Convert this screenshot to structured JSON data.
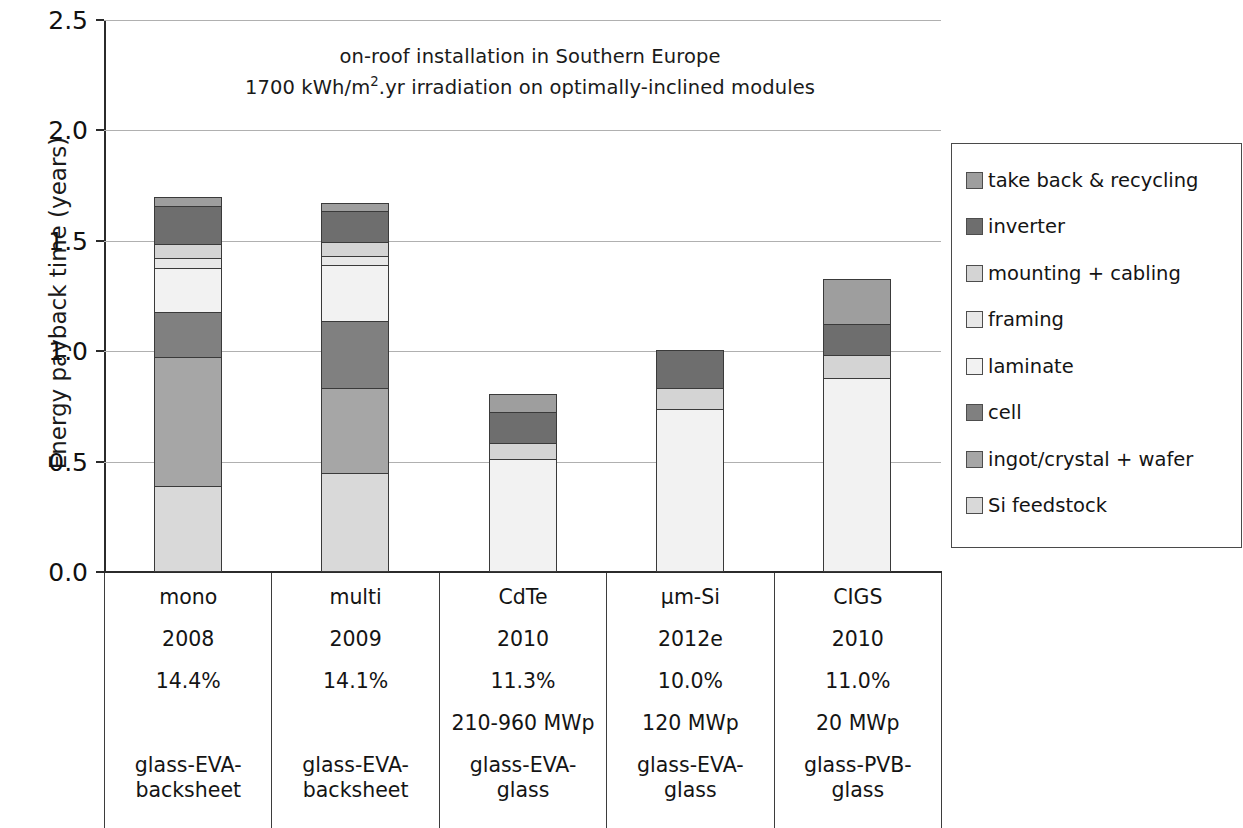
{
  "chart_data": {
    "type": "bar",
    "subtype": "stacked-bar",
    "title": "on-roof installation in Southern Europe\n1700 kWh/m2.yr irradiation on optimally-inclined modules",
    "title_lines": [
      "on-roof installation in Southern Europe",
      "1700 kWh/m².yr irradiation on optimally-inclined modules"
    ],
    "xlabel": "",
    "ylabel": "Energy payback time (years)",
    "ylim": [
      0.0,
      2.5
    ],
    "ytick_labels": [
      "2.5",
      "2.0",
      "1.5",
      "1.0",
      "0.5",
      "0.0"
    ],
    "ytick_values": [
      2.5,
      2.0,
      1.5,
      1.0,
      0.5,
      0.0
    ],
    "grid": "horizontal",
    "legend_position": "right",
    "categories": [
      "mono",
      "multi",
      "CdTe",
      "μm-Si",
      "CIGS"
    ],
    "stack_order_bottom_to_top": [
      "Si feedstock",
      "ingot/crystal + wafer",
      "cell",
      "laminate",
      "framing",
      "mounting + cabling",
      "inverter",
      "take back & recycling"
    ],
    "series": [
      {
        "name": "Si feedstock",
        "color": "#d9d9d9",
        "values": [
          0.39,
          0.45,
          0.0,
          0.0,
          0.0
        ]
      },
      {
        "name": "ingot/crystal + wafer",
        "color": "#a6a6a6",
        "values": [
          0.59,
          0.39,
          0.0,
          0.0,
          0.0
        ]
      },
      {
        "name": "cell",
        "color": "#808080",
        "values": [
          0.21,
          0.31,
          0.0,
          0.0,
          0.0
        ]
      },
      {
        "name": "laminate",
        "color": "#f2f2f2",
        "values": [
          0.21,
          0.26,
          0.51,
          0.74,
          0.88
        ]
      },
      {
        "name": "framing",
        "color": "#e8e8e8",
        "values": [
          0.05,
          0.05,
          0.0,
          0.0,
          0.0
        ]
      },
      {
        "name": "mounting + cabling",
        "color": "#d4d4d4",
        "values": [
          0.07,
          0.07,
          0.08,
          0.1,
          0.11
        ]
      },
      {
        "name": "inverter",
        "color": "#6e6e6e",
        "values": [
          0.18,
          0.15,
          0.15,
          0.18,
          0.15
        ]
      },
      {
        "name": "take back & recycling",
        "color": "#9e9e9e",
        "values": [
          0.05,
          0.04,
          0.09,
          0.0,
          0.21
        ]
      }
    ],
    "totals": [
      1.75,
      1.72,
      0.83,
      1.02,
      1.35
    ],
    "annotations": []
  },
  "legend": {
    "items": [
      {
        "label": "take back & recycling",
        "color": "#9e9e9e"
      },
      {
        "label": "inverter",
        "color": "#6e6e6e"
      },
      {
        "label": "mounting + cabling",
        "color": "#d4d4d4"
      },
      {
        "label": "framing",
        "color": "#e8e8e8"
      },
      {
        "label": "laminate",
        "color": "#f2f2f2"
      },
      {
        "label": "cell",
        "color": "#808080"
      },
      {
        "label": "ingot/crystal + wafer",
        "color": "#a6a6a6"
      },
      {
        "label": "Si feedstock",
        "color": "#d9d9d9"
      }
    ]
  },
  "category_table": {
    "rows": [
      "technology",
      "year",
      "efficiency",
      "capacity",
      "encapsulation"
    ],
    "columns": [
      {
        "technology": "mono",
        "year": "2008",
        "efficiency": "14.4%",
        "capacity": "",
        "encapsulation": "glass-EVA-backsheet"
      },
      {
        "technology": "multi",
        "year": "2009",
        "efficiency": "14.1%",
        "capacity": "",
        "encapsulation": "glass-EVA-backsheet"
      },
      {
        "technology": "CdTe",
        "year": "2010",
        "efficiency": "11.3%",
        "capacity": "210-960 MWp",
        "encapsulation": "glass-EVA-glass"
      },
      {
        "technology": "μm-Si",
        "year": "2012e",
        "efficiency": "10.0%",
        "capacity": "120 MWp",
        "encapsulation": "glass-EVA-glass"
      },
      {
        "technology": "CIGS",
        "year": "2010",
        "efficiency": "11.0%",
        "capacity": "20 MWp",
        "encapsulation": "glass-PVB-glass"
      }
    ]
  }
}
